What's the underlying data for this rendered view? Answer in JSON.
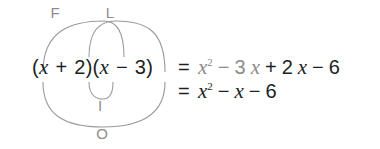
{
  "figure": {
    "kind": "foil-method-diagram",
    "background_color": "#ffffff",
    "arc_color": "#9a9a9a",
    "label_color": "#8d8d8d",
    "text_color": "#201f1f",
    "dim_text_color": "#8b8b8b"
  },
  "expression": {
    "full_text": "(x + 2)(x − 3)",
    "open_paren_1": "(",
    "var_1": "x",
    "op_1": "+",
    "const_1": "2",
    "close_paren_1": ")",
    "open_paren_2": "(",
    "var_2": "x",
    "op_2": "−",
    "const_2": "3",
    "close_paren_2": ")"
  },
  "arcs": [
    {
      "name": "first",
      "letter": "F",
      "meaning": "First terms",
      "connects": [
        "x",
        "x"
      ],
      "product": "x²",
      "color": "#9a9a9a"
    },
    {
      "name": "outer",
      "letter": "O",
      "meaning": "Outer terms",
      "connects": [
        "x",
        "-3"
      ],
      "product": "−3x",
      "color": "#9a9a9a"
    },
    {
      "name": "inner",
      "letter": "I",
      "meaning": "Inner terms",
      "connects": [
        "+2",
        "x"
      ],
      "product": "+2x",
      "color": "#9a9a9a"
    },
    {
      "name": "last",
      "letter": "L",
      "meaning": "Last terms",
      "connects": [
        "+2",
        "-3"
      ],
      "product": "−6",
      "color": "#9a9a9a"
    }
  ],
  "equations": {
    "line1": {
      "eqsign": "=",
      "tokens": [
        {
          "text": "x",
          "italic": true,
          "sup": "2",
          "dim": true
        },
        {
          "text": "−",
          "dim": true
        },
        {
          "text": "3",
          "dim": true
        },
        {
          "text": "x",
          "italic": true,
          "dim": true
        },
        {
          "text": "+",
          "dim": false
        },
        {
          "text": "2",
          "dim": false
        },
        {
          "text": "x",
          "italic": true,
          "dim": false
        },
        {
          "text": "−",
          "dim": false
        },
        {
          "text": "6",
          "dim": false
        }
      ],
      "plain_text": "= x² − 3x + 2x − 6"
    },
    "line2": {
      "eqsign": "=",
      "tokens": [
        {
          "text": "x",
          "italic": true,
          "sup": "2",
          "dim": false
        },
        {
          "text": "−",
          "dim": false
        },
        {
          "text": "x",
          "italic": true,
          "dim": false
        },
        {
          "text": "−",
          "dim": false
        },
        {
          "text": "6",
          "dim": false
        }
      ],
      "plain_text": "= x² − x − 6"
    }
  },
  "chart_data": {
    "type": "diagram",
    "steps": [
      {
        "label": "F",
        "terms": "x · x",
        "result": "x²"
      },
      {
        "label": "O",
        "terms": "x · (−3)",
        "result": "−3x"
      },
      {
        "label": "I",
        "terms": "2 · x",
        "result": "+2x"
      },
      {
        "label": "L",
        "terms": "2 · (−3)",
        "result": "−6"
      }
    ],
    "expanded": "x² − 3x + 2x − 6",
    "simplified": "x² − x − 6"
  }
}
